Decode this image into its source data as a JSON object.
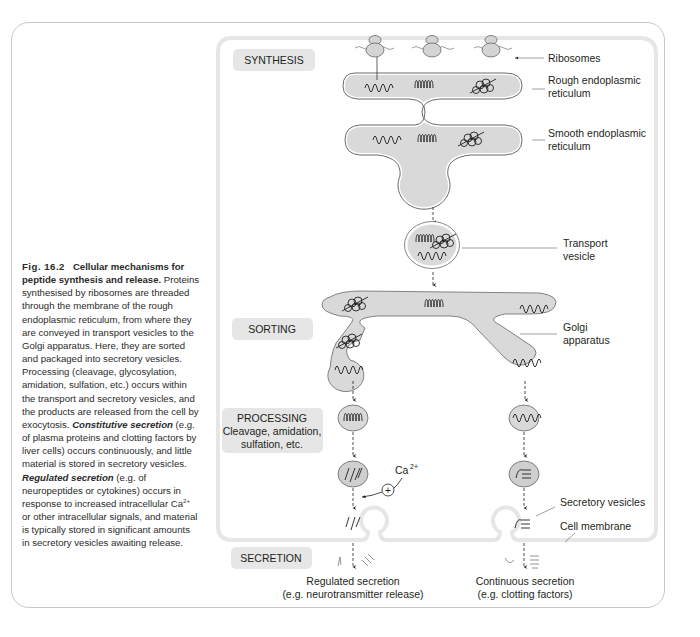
{
  "caption": {
    "fig_number": "Fig. 16.2",
    "title": "Cellular mechanisms for peptide synthesis and release.",
    "body_1": "Proteins synthesised by ribosomes are threaded through the membrane of the rough endoplasmic reticulum, from where they are conveyed in transport vesicles to the Golgi apparatus. Here, they are sorted and packaged into secretory vesicles. Processing (cleavage, glycosylation, amidation, sulfation, etc.) occurs within the transport and secretory vesicles, and the products are released from the cell by exocytosis. ",
    "constitutive_term": "Constitutive secretion",
    "body_2": " (e.g. of plasma proteins and clotting factors by liver cells) occurs continuously, and little material is stored in secretory vesicles. ",
    "regulated_term": "Regulated secretion",
    "body_3": " (e.g. of neuropeptides or cytokines) occurs in response to increased intracellular Ca",
    "ca_superscript": "2+",
    "body_4": " or other intracellular signals, and material is typically stored in significant amounts in secretory vesicles awaiting release."
  },
  "stages": {
    "synthesis": "SYNTHESIS",
    "sorting": "SORTING",
    "processing_title": "PROCESSING",
    "processing_line1": "Cleavage, amidation,",
    "processing_line2": "sulfation, etc.",
    "secretion": "SECRETION"
  },
  "labels": {
    "ribosomes": "Ribosomes",
    "rer_line1": "Rough endoplasmic",
    "rer_line2": "reticulum",
    "ser_line1": "Smooth endoplasmic",
    "ser_line2": "reticulum",
    "transport_line1": "Transport",
    "transport_line2": "vesicle",
    "golgi_line1": "Golgi",
    "golgi_line2": "apparatus",
    "calcium": "Ca",
    "calcium_sup": "2+",
    "plus": "+",
    "secretory_vesicles": "Secretory vesicles",
    "cell_membrane": "Cell membrane",
    "regulated_line1": "Regulated secretion",
    "regulated_line2": "(e.g. neurotransmitter release)",
    "continuous_line1": "Continuous secretion",
    "continuous_line2": "(e.g. clotting factors)"
  },
  "colors": {
    "organelle_fill": "#d9d9d9",
    "stage_box": "#e6e6e6",
    "cell_outline": "#e8e8e8",
    "frame": "#c8c8c8",
    "ink": "#231f20"
  }
}
